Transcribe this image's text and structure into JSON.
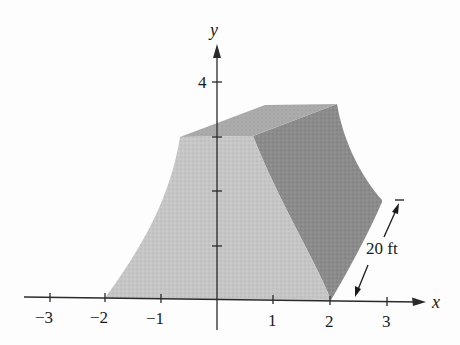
{
  "figure": {
    "axes": {
      "x_label": "x",
      "y_label": "y",
      "x_ticks": [
        "−3",
        "−2",
        "−1",
        "1",
        "2",
        "3"
      ],
      "y_ticks": [
        "4"
      ]
    },
    "dimension_label": "20 ft",
    "colors": {
      "front_face": "#c4c4c4",
      "side_face": "#8a8a8a",
      "top_face": "#a8a8a8",
      "axis": "#2a2a2a"
    }
  }
}
